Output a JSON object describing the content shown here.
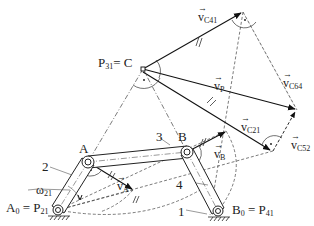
{
  "diagram": {
    "points": {
      "C": {
        "label": "P",
        "sub": "31",
        "suffix": "= C"
      },
      "A": {
        "label": "A"
      },
      "B": {
        "label": "B"
      },
      "A0": {
        "label": "A",
        "sub": "0",
        "suffix": "= P",
        "sub2": "21"
      },
      "B0": {
        "label": "B",
        "sub": "0",
        "suffix": "= P",
        "sub2": "41"
      }
    },
    "links": {
      "l1": "1",
      "l2": "2",
      "l3": "3",
      "l4": "4"
    },
    "omega": {
      "symbol": "ω",
      "sub": "21"
    },
    "vectors": {
      "vC41": {
        "symbol": "v",
        "sub": "C41"
      },
      "vP": {
        "symbol": "v",
        "sub": "P"
      },
      "vC64": {
        "symbol": "v",
        "sub": "C64"
      },
      "vC21": {
        "symbol": "v",
        "sub": "C21"
      },
      "vC52": {
        "symbol": "v",
        "sub": "C52"
      },
      "vA": {
        "symbol": "v",
        "sub": "A"
      },
      "vB": {
        "symbol": "v",
        "sub": "B"
      }
    },
    "arrow_glyph": "→"
  }
}
